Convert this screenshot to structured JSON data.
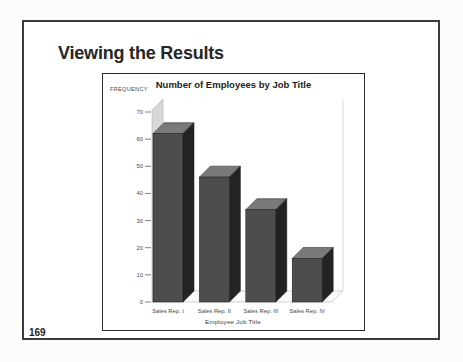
{
  "slide": {
    "title": "Viewing the Results",
    "page_number": "169"
  },
  "chart_data": {
    "type": "bar",
    "style": "3d",
    "title": "Number of Employees by Job Title",
    "xlabel": "Employee Job Title",
    "ylabel": "FREQUENCY",
    "categories": [
      "Sales Rep. I",
      "Sales Rep. II",
      "Sales Rep. III",
      "Sales Rep. IV"
    ],
    "values": [
      62,
      46,
      34,
      16
    ],
    "y_ticks": [
      0,
      10,
      20,
      30,
      40,
      50,
      60,
      70
    ],
    "ylim": [
      0,
      70
    ],
    "grid": false,
    "legend": false
  },
  "colors": {
    "bar_front": "#4d4d4d",
    "bar_side": "#232323",
    "bar_top": "#7a7a7a",
    "bar_outline": "#161616",
    "wall": "#d7d7d5",
    "wall_edge": "#b3b3b1",
    "floor": "#fbfbfa",
    "back_edge": "#cfcfcf",
    "tick": "#4a4a4a"
  }
}
